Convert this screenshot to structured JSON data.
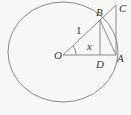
{
  "diagram": {
    "type": "unit-circle-trigonometry",
    "labels": {
      "O": "O",
      "A": "A",
      "B": "B",
      "C": "C",
      "D": "D",
      "radius": "1",
      "angle": "x"
    },
    "colors": {
      "stroke": "#8a8a8a",
      "text": "#333333",
      "background": "#f7f7f5"
    }
  }
}
